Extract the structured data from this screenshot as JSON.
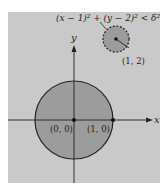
{
  "figure": {
    "colors": {
      "page_background": "#ffffff",
      "panel": "#c9c9c9",
      "disk_fill": "#9c9c9c",
      "stroke": "#222222"
    },
    "axes": {
      "x_label": "x",
      "y_label": "y"
    },
    "large_disk": {
      "center_label": "(0, 0)",
      "edge_point_label": "(1, 0)"
    },
    "small_disk": {
      "center_label": "(1, 2)",
      "inequality_label": "(x − 1)² + (y − 2)² < δ²"
    }
  }
}
